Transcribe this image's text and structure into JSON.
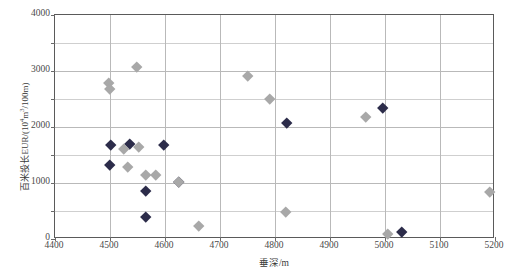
{
  "chart": {
    "type": "scatter",
    "title": "",
    "xlabel": "垂深/m",
    "ylabel_prefix": "百米投长EUR/(10",
    "ylabel_sup": "4",
    "ylabel_mid": "m",
    "ylabel_sup2": "3",
    "ylabel_suffix": "/100m)",
    "ylabel_full": "百米投长EUR/(10⁴m³/100m)"
  },
  "axes": {
    "x_ticks": [
      "4400",
      "4500",
      "4600",
      "4700",
      "4800",
      "4900",
      "5000",
      "5100",
      "5200"
    ],
    "y_ticks": [
      "0",
      "1000",
      "2000",
      "3000",
      "4000"
    ],
    "xlim": [
      4400,
      5200
    ],
    "ylim": [
      0,
      4000
    ],
    "x_major_step": 100,
    "y_major_step": 1000,
    "y_minor_step": 500,
    "grid": "both"
  },
  "colors": {
    "series_dark": "#2c2c4a",
    "series_gray": "#a8a8a8",
    "grid_major": "#b9b9b9",
    "grid_minor": "#cfcfcf",
    "frame": "#5a5a5a"
  },
  "chart_data": {
    "type": "scatter",
    "title": "",
    "xlabel": "垂深/m",
    "ylabel": "百米投长EUR/(10⁴m³/100m)",
    "xlim": [
      4400,
      5200
    ],
    "ylim": [
      0,
      4000
    ],
    "grid": true,
    "legend": null,
    "series": [
      {
        "name": "series-dark",
        "color": "#2c2c4a",
        "marker": "diamond",
        "points": [
          {
            "x": 4500,
            "y": 1330
          },
          {
            "x": 4502,
            "y": 1680
          },
          {
            "x": 4535,
            "y": 1700
          },
          {
            "x": 4565,
            "y": 870
          },
          {
            "x": 4565,
            "y": 400
          },
          {
            "x": 4598,
            "y": 1690
          },
          {
            "x": 4625,
            "y": 1030
          },
          {
            "x": 4822,
            "y": 2070
          },
          {
            "x": 4995,
            "y": 2350
          },
          {
            "x": 5030,
            "y": 130
          }
        ]
      },
      {
        "name": "series-gray",
        "color": "#a8a8a8",
        "marker": "diamond",
        "points": [
          {
            "x": 4498,
            "y": 2790
          },
          {
            "x": 4500,
            "y": 2680
          },
          {
            "x": 4525,
            "y": 1620
          },
          {
            "x": 4533,
            "y": 1290
          },
          {
            "x": 4548,
            "y": 3070
          },
          {
            "x": 4552,
            "y": 1650
          },
          {
            "x": 4565,
            "y": 1150
          },
          {
            "x": 4583,
            "y": 1150
          },
          {
            "x": 4625,
            "y": 1020
          },
          {
            "x": 4662,
            "y": 230
          },
          {
            "x": 4750,
            "y": 2910
          },
          {
            "x": 4790,
            "y": 2510
          },
          {
            "x": 4820,
            "y": 480
          },
          {
            "x": 4965,
            "y": 2180
          },
          {
            "x": 5005,
            "y": 100
          },
          {
            "x": 5190,
            "y": 840
          }
        ]
      }
    ]
  }
}
